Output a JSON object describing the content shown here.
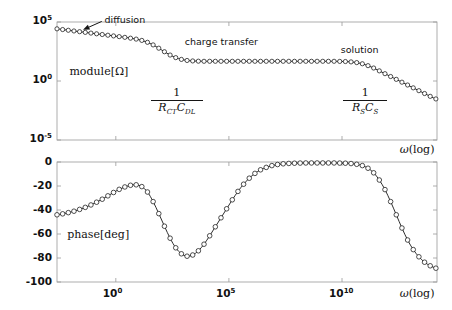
{
  "figure": {
    "title": "",
    "background": "#ffffff",
    "curve_color": "#151515",
    "axis_color": "#9a9a9a"
  },
  "chart_data": [
    {
      "type": "line",
      "id": "magnitude-bode-plot",
      "title": "",
      "xlabel": "ω(log)",
      "ylabel": "module[Ω]",
      "x_scale": "log",
      "y_scale": "log",
      "xlim": [
        -2.6,
        14.2
      ],
      "ylim": [
        -5,
        5
      ],
      "x_tick_labels": [
        "10⁰",
        "10⁵",
        "10¹⁰"
      ],
      "x_tick_exponents": [
        0,
        5,
        10
      ],
      "y_tick_labels": [
        "10⁵",
        "10⁰",
        "10⁻⁵"
      ],
      "y_tick_exponents": [
        5,
        0,
        -5
      ],
      "grid": false,
      "legend": "none",
      "series": [
        {
          "name": "|Z|",
          "marker": "open-circle",
          "x_log": [
            -2.6,
            -2.35,
            -2.1,
            -1.85,
            -1.6,
            -1.35,
            -1.1,
            -0.85,
            -0.6,
            -0.35,
            -0.1,
            0.15,
            0.4,
            0.65,
            0.9,
            1.15,
            1.4,
            1.65,
            1.9,
            2.15,
            2.4,
            2.65,
            2.9,
            3.15,
            3.4,
            3.65,
            3.9,
            4.15,
            4.4,
            4.65,
            4.9,
            5.15,
            5.4,
            5.65,
            5.9,
            6.15,
            6.4,
            6.65,
            6.9,
            7.15,
            7.4,
            7.65,
            7.9,
            8.15,
            8.4,
            8.65,
            8.9,
            9.15,
            9.4,
            9.65,
            9.9,
            10.15,
            10.4,
            10.65,
            10.9,
            11.15,
            11.4,
            11.65,
            11.9,
            12.15,
            12.4,
            12.65,
            12.9,
            13.15,
            13.4,
            13.65,
            13.9,
            14.15
          ],
          "y_log": [
            4.42,
            4.36,
            4.3,
            4.24,
            4.18,
            4.12,
            4.06,
            4.0,
            3.94,
            3.88,
            3.82,
            3.76,
            3.7,
            3.63,
            3.55,
            3.44,
            3.28,
            3.06,
            2.78,
            2.48,
            2.2,
            1.98,
            1.83,
            1.74,
            1.7,
            1.68,
            1.67,
            1.67,
            1.67,
            1.67,
            1.67,
            1.67,
            1.67,
            1.67,
            1.67,
            1.67,
            1.67,
            1.67,
            1.67,
            1.67,
            1.67,
            1.67,
            1.67,
            1.67,
            1.67,
            1.67,
            1.67,
            1.67,
            1.67,
            1.67,
            1.66,
            1.65,
            1.62,
            1.56,
            1.46,
            1.3,
            1.1,
            0.86,
            0.62,
            0.38,
            0.14,
            -0.1,
            -0.34,
            -0.58,
            -0.82,
            -1.06,
            -1.3,
            -1.52
          ]
        }
      ],
      "annotations": [
        {
          "text": "diffusion",
          "x_log": -0.55,
          "y_log": 5.35,
          "kind": "arrow-label",
          "arrow_to_x_log": -1.4,
          "arrow_to_y_log": 4.35
        },
        {
          "text": "charge transfer",
          "x_log": 3.5,
          "y_log": 3.45
        },
        {
          "text": "solution",
          "x_log": 10.5,
          "y_log": 2.9
        },
        {
          "text": "1/(R_CT C_DL)",
          "numerator": "1",
          "den_main": "R",
          "den_sub": "CT",
          "den_main2": "C",
          "den_sub2": "DL",
          "x_log": 1.95,
          "y_log": -1.4
        },
        {
          "text": "1/(R_S C_S)",
          "numerator": "1",
          "den_main": "R",
          "den_sub": "S",
          "den_main2": "C",
          "den_sub2": "S",
          "x_log": 10.4,
          "y_log": -1.4
        }
      ]
    },
    {
      "type": "line",
      "id": "phase-bode-plot",
      "title": "",
      "xlabel": "ω(log)",
      "ylabel": "phase[deg]",
      "x_scale": "log",
      "y_scale": "linear",
      "xlim": [
        -2.6,
        14.2
      ],
      "ylim": [
        -100,
        0
      ],
      "x_tick_labels": [
        "10⁰",
        "10⁵",
        "10¹⁰"
      ],
      "x_tick_exponents": [
        0,
        5,
        10
      ],
      "y_tick_labels": [
        "0",
        "-20",
        "-40",
        "-60",
        "-80",
        "-100"
      ],
      "y_tick_values": [
        0,
        -20,
        -40,
        -60,
        -80,
        -100
      ],
      "grid": false,
      "legend": "none",
      "series": [
        {
          "name": "phase",
          "marker": "open-circle",
          "x_log": [
            -2.6,
            -2.35,
            -2.1,
            -1.85,
            -1.6,
            -1.35,
            -1.1,
            -0.85,
            -0.6,
            -0.35,
            -0.1,
            0.15,
            0.4,
            0.65,
            0.9,
            1.15,
            1.4,
            1.65,
            1.9,
            2.15,
            2.4,
            2.65,
            2.9,
            3.15,
            3.4,
            3.65,
            3.9,
            4.15,
            4.4,
            4.65,
            4.9,
            5.15,
            5.4,
            5.65,
            5.9,
            6.15,
            6.4,
            6.65,
            6.9,
            7.15,
            7.4,
            7.65,
            7.9,
            8.15,
            8.4,
            8.65,
            8.9,
            9.15,
            9.4,
            9.65,
            9.9,
            10.15,
            10.4,
            10.65,
            10.9,
            11.15,
            11.4,
            11.65,
            11.9,
            12.15,
            12.4,
            12.65,
            12.9,
            13.15,
            13.4,
            13.65,
            13.9,
            14.15
          ],
          "y": [
            -44.0,
            -43.2,
            -42.2,
            -41.0,
            -39.5,
            -37.8,
            -35.8,
            -33.5,
            -31.0,
            -28.2,
            -25.4,
            -22.8,
            -20.8,
            -19.4,
            -19.0,
            -20.5,
            -25.0,
            -33.0,
            -43.0,
            -53.5,
            -63.5,
            -71.5,
            -76.5,
            -78.5,
            -77.5,
            -74.0,
            -68.5,
            -61.5,
            -54.0,
            -46.5,
            -39.0,
            -31.5,
            -24.5,
            -18.5,
            -13.5,
            -9.5,
            -6.5,
            -4.5,
            -3.0,
            -2.1,
            -1.5,
            -1.2,
            -1.0,
            -0.9,
            -0.8,
            -0.8,
            -0.8,
            -0.8,
            -0.8,
            -0.8,
            -0.9,
            -1.0,
            -1.3,
            -1.9,
            -3.0,
            -5.2,
            -9.0,
            -15.0,
            -23.0,
            -33.0,
            -44.0,
            -55.0,
            -65.0,
            -73.0,
            -79.0,
            -83.5,
            -86.5,
            -88.5
          ]
        }
      ],
      "annotations": [
        {
          "text": "phase[deg]",
          "x_log": -1.5,
          "y": -53
        }
      ]
    }
  ],
  "labels": {
    "top_ylabel": "module[Ω]",
    "bottom_ylabel": "phase[deg]",
    "xaxis_name": "(log)",
    "omega": "ω",
    "annotation_diffusion": "diffusion",
    "annotation_charge_transfer": "charge transfer",
    "annotation_solution": "solution",
    "top_ytick_1": "10",
    "top_ytick_1_exp": "5",
    "top_ytick_2": "10",
    "top_ytick_2_exp": "0",
    "top_ytick_3": "10",
    "top_ytick_3_exp": "-5",
    "bottom_ytick_1": "0",
    "bottom_ytick_2": "-20",
    "bottom_ytick_3": "-40",
    "bottom_ytick_4": "-60",
    "bottom_ytick_5": "-80",
    "bottom_ytick_6": "-100",
    "xtick_1": "10",
    "xtick_1_exp": "0",
    "xtick_2": "10",
    "xtick_2_exp": "5",
    "xtick_3": "10",
    "xtick_3_exp": "10",
    "frac1_num": "1",
    "frac1_den_R": "R",
    "frac1_den_R_sub": "CT",
    "frac1_den_C": "C",
    "frac1_den_C_sub": "DL",
    "frac2_num": "1",
    "frac2_den_R": "R",
    "frac2_den_R_sub": "S",
    "frac2_den_C": "C",
    "frac2_den_C_sub": "S"
  }
}
